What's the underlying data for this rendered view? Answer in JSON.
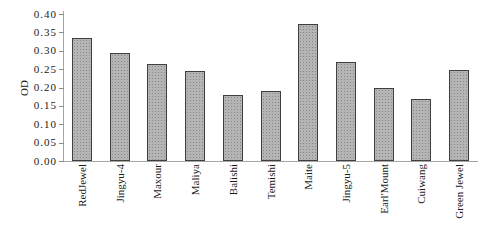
{
  "chart_data": {
    "type": "bar",
    "title": "",
    "xlabel": "",
    "ylabel": "OD",
    "categories": [
      "RedJewel",
      "Jingyu-4",
      "Maxour",
      "Maliya",
      "Balishi",
      "Temishi",
      "Maite",
      "Jingyu-5",
      "Earl'Mount",
      "Cuiwang",
      "Green Jewel"
    ],
    "values": [
      0.335,
      0.295,
      0.265,
      0.245,
      0.18,
      0.19,
      0.372,
      0.27,
      0.2,
      0.17,
      0.248
    ],
    "ylim": [
      0.0,
      0.4
    ],
    "ytick_step": 0.05,
    "ytick_labels": [
      "0.00",
      "0.05",
      "0.10",
      "0.15",
      "0.20",
      "0.25",
      "0.30",
      "0.35",
      "0.40"
    ],
    "grid": false,
    "legend": false,
    "colors": {
      "background": "#ffffff",
      "bar_fill": "#b5b5b5",
      "bar_border": "#3f3f3f",
      "axis": "#a6a6a6",
      "tick_mark": "#8c8c8c",
      "text": "#1a1a1a"
    }
  }
}
